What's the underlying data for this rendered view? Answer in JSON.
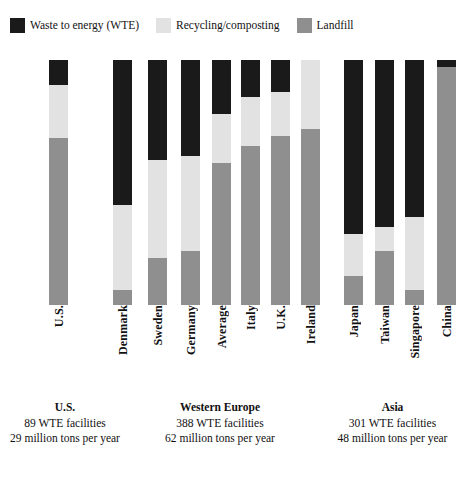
{
  "legend": {
    "items": [
      {
        "label": "Waste to energy (WTE)",
        "key": "wte",
        "color": "#1a1a1a",
        "icon": "legend-swatch-wte"
      },
      {
        "label": "Recycling/composting",
        "key": "recycling",
        "color": "#e2e2e2",
        "icon": "legend-swatch-recycling"
      },
      {
        "label": "Landfill",
        "key": "landfill",
        "color": "#8f8f8f",
        "icon": "legend-swatch-landfill"
      }
    ]
  },
  "colors": {
    "wte": "#1a1a1a",
    "recycling": "#e2e2e2",
    "landfill": "#8f8f8f",
    "background": "#ffffff",
    "text": "#111111"
  },
  "groups": [
    {
      "name": "U.S.",
      "title": "U.S.",
      "facilities": "89 WTE facilities",
      "tons": "29 million tons per year"
    },
    {
      "name": "Western Europe",
      "title": "Western Europe",
      "facilities": "388 WTE facilities",
      "tons": "62 million tons per year"
    },
    {
      "name": "Asia",
      "title": "Asia",
      "facilities": "301 WTE facilities",
      "tons": "48 million tons per year"
    }
  ],
  "chart_data": {
    "type": "bar",
    "subtype": "stacked-100-percent",
    "title": "",
    "subtitle": "",
    "xlabel": "",
    "ylabel": "",
    "ylim": [
      0,
      100
    ],
    "grid": false,
    "legend_position": "top-left",
    "stack_order": [
      "Waste to energy (WTE)",
      "Recycling/composting",
      "Landfill"
    ],
    "categories": [
      "U.S.",
      "Denmark",
      "Sweden",
      "Germany",
      "Average",
      "Italy",
      "U.K.",
      "Ireland",
      "Japan",
      "Taiwan",
      "Singapore",
      "China"
    ],
    "group_of_category": [
      "U.S.",
      "Western Europe",
      "Western Europe",
      "Western Europe",
      "Western Europe",
      "Western Europe",
      "Western Europe",
      "Western Europe",
      "Asia",
      "Asia",
      "Asia",
      "Asia"
    ],
    "series": [
      {
        "name": "Waste to energy (WTE)",
        "color": "#1a1a1a",
        "values": [
          10,
          59,
          41,
          39,
          22,
          15,
          13,
          0,
          71,
          68,
          64,
          3
        ]
      },
      {
        "name": "Recycling/composting",
        "color": "#e2e2e2",
        "values": [
          22,
          35,
          40,
          39,
          20,
          20,
          18,
          28,
          17,
          10,
          30,
          0
        ]
      },
      {
        "name": "Landfill",
        "color": "#8f8f8f",
        "values": [
          68,
          6,
          19,
          22,
          58,
          65,
          69,
          72,
          12,
          22,
          6,
          97
        ]
      }
    ],
    "units": "percent of municipal solid waste"
  },
  "bars": [
    {
      "category": "U.S.",
      "x": 49,
      "width": 19,
      "wte": 10,
      "recycling": 22,
      "landfill": 68
    },
    {
      "category": "Denmark",
      "x": 113,
      "width": 19,
      "wte": 59,
      "recycling": 35,
      "landfill": 6
    },
    {
      "category": "Sweden",
      "x": 148,
      "width": 19,
      "wte": 41,
      "recycling": 40,
      "landfill": 19
    },
    {
      "category": "Germany",
      "x": 181,
      "width": 19,
      "wte": 39,
      "recycling": 39,
      "landfill": 22
    },
    {
      "category": "Average",
      "x": 212,
      "width": 19,
      "wte": 22,
      "recycling": 20,
      "landfill": 58
    },
    {
      "category": "Italy",
      "x": 241,
      "width": 19,
      "wte": 15,
      "recycling": 20,
      "landfill": 65
    },
    {
      "category": "U.K.",
      "x": 271,
      "width": 19,
      "wte": 13,
      "recycling": 18,
      "landfill": 69
    },
    {
      "category": "Ireland",
      "x": 301,
      "width": 19,
      "wte": 0,
      "recycling": 28,
      "landfill": 72
    },
    {
      "category": "Japan",
      "x": 344,
      "width": 19,
      "wte": 71,
      "recycling": 17,
      "landfill": 12
    },
    {
      "category": "Taiwan",
      "x": 375,
      "width": 19,
      "wte": 68,
      "recycling": 10,
      "landfill": 22
    },
    {
      "category": "Singapore",
      "x": 405,
      "width": 19,
      "wte": 64,
      "recycling": 30,
      "landfill": 6
    },
    {
      "category": "China",
      "x": 437,
      "width": 19,
      "wte": 3,
      "recycling": 0,
      "landfill": 97
    }
  ],
  "caption_positions": [
    {
      "group": "U.S.",
      "left": 10,
      "width": 110
    },
    {
      "group": "Western Europe",
      "left": 130,
      "width": 180
    },
    {
      "group": "Asia",
      "left": 320,
      "width": 145
    }
  ]
}
